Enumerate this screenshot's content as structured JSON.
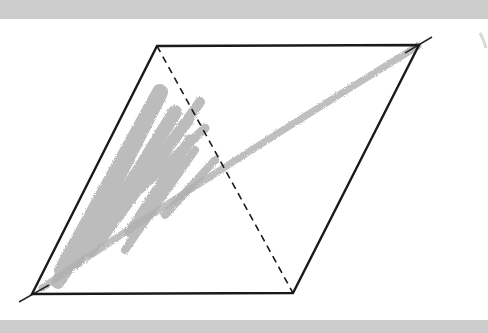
{
  "figure": {
    "type": "parallelogram",
    "vertices": {
      "top_left": [
        157,
        46
      ],
      "top_right": [
        419,
        45
      ],
      "bottom_right": [
        293,
        293
      ],
      "bottom_left": [
        32,
        294
      ]
    },
    "dashed_diagonal": {
      "from": "top_left",
      "to": "bottom_right"
    },
    "extended_diagonal": {
      "from": [
        19,
        302
      ],
      "to": [
        432,
        37
      ]
    },
    "shaded_region": "left triangle (top_left, bottom_left, bottom_right side of dashed diagonal)",
    "colors": {
      "outline": "#1a1a1a",
      "shading": "#9a9a9a",
      "band": "#cdcdcd",
      "background": "#ffffff"
    }
  }
}
